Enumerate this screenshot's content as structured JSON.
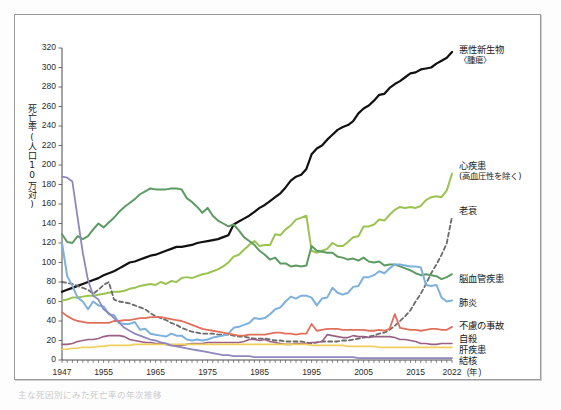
{
  "figure": {
    "y_axis_title": "死亡率(人口10万対)",
    "x_axis_unit": "(年)",
    "caption": "主な死因別にみた死亡率の年次推移"
  },
  "chart_data": {
    "type": "line",
    "title": "",
    "xlabel": "(年)",
    "ylabel": "死亡率(人口10万対)",
    "xlim": [
      1947,
      2022
    ],
    "ylim": [
      0,
      320
    ],
    "grid": false,
    "legend_position": "right-inline-labels",
    "y_ticks": [
      0,
      20,
      40,
      60,
      80,
      100,
      120,
      140,
      160,
      180,
      200,
      220,
      240,
      260,
      280,
      300,
      320
    ],
    "x_ticks": [
      1947,
      1955,
      1965,
      1975,
      1985,
      1995,
      2005,
      2015,
      2022
    ],
    "x": [
      1947,
      1948,
      1949,
      1950,
      1951,
      1952,
      1953,
      1954,
      1955,
      1956,
      1957,
      1958,
      1959,
      1960,
      1961,
      1962,
      1963,
      1964,
      1965,
      1966,
      1967,
      1968,
      1969,
      1970,
      1971,
      1972,
      1973,
      1974,
      1975,
      1976,
      1977,
      1978,
      1979,
      1980,
      1981,
      1982,
      1983,
      1984,
      1985,
      1986,
      1987,
      1988,
      1989,
      1990,
      1991,
      1992,
      1993,
      1994,
      1995,
      1996,
      1997,
      1998,
      1999,
      2000,
      2001,
      2002,
      2003,
      2004,
      2005,
      2006,
      2007,
      2008,
      2009,
      2010,
      2011,
      2012,
      2013,
      2014,
      2015,
      2016,
      2017,
      2018,
      2019,
      2020,
      2021,
      2022
    ],
    "series": [
      {
        "name": "悪性新生物〈腫瘍〉",
        "label": "悪性新生物",
        "sublabel": "〈腫瘍〉",
        "color": "#111111",
        "width": 2.2,
        "dash": "none",
        "label_y": 44,
        "values": [
          70,
          72,
          74,
          76,
          78,
          80,
          82,
          84,
          87,
          89,
          91,
          94,
          97,
          100,
          101,
          103,
          105,
          107,
          108,
          110,
          112,
          114,
          116,
          116,
          117,
          118,
          120,
          121,
          122,
          123,
          124,
          126,
          128,
          139,
          142,
          145,
          148,
          152,
          156,
          159,
          163,
          167,
          171,
          177,
          184,
          188,
          190,
          196,
          211,
          217,
          220,
          226,
          231,
          236,
          239,
          241,
          245,
          253,
          258,
          261,
          266,
          272,
          273,
          279,
          283,
          286,
          290,
          294,
          295,
          298,
          299,
          300,
          304,
          307,
          310,
          316
        ]
      },
      {
        "name": "心疾患(高血圧性を除く)",
        "label": "心疾患",
        "sublabel": "(高血圧性を除く)",
        "color": "#9ac352",
        "width": 2.0,
        "dash": "none",
        "label_y": 160,
        "values": [
          61,
          62,
          64,
          64,
          65,
          66,
          66,
          67,
          68,
          69,
          70,
          70,
          71,
          73,
          74,
          76,
          77,
          78,
          77,
          80,
          78,
          81,
          80,
          84,
          85,
          84,
          86,
          88,
          89,
          91,
          93,
          96,
          100,
          106,
          108,
          113,
          118,
          122,
          117,
          118,
          118,
          129,
          128,
          134,
          138,
          144,
          146,
          148,
          112,
          110,
          112,
          114,
          120,
          117,
          117,
          121,
          126,
          127,
          137,
          137,
          139,
          144,
          143,
          149,
          154,
          157,
          156,
          157,
          156,
          158,
          164,
          167,
          168,
          167,
          174,
          191
        ]
      },
      {
        "name": "老衰",
        "label": "老衰",
        "sublabel": "",
        "color": "#6b6b6b",
        "width": 1.8,
        "dash": "4 3",
        "label_y": 205,
        "values": [
          80,
          79,
          78,
          76,
          74,
          72,
          68,
          72,
          77,
          80,
          62,
          60,
          59,
          58,
          56,
          54,
          52,
          48,
          45,
          43,
          41,
          38,
          36,
          33,
          31,
          29,
          28,
          27,
          27,
          27,
          26,
          26,
          26,
          25,
          24,
          24,
          23,
          22,
          22,
          22,
          21,
          20,
          20,
          19,
          19,
          19,
          19,
          18,
          17,
          18,
          19,
          19,
          19,
          19,
          20,
          20,
          21,
          22,
          23,
          24,
          25,
          27,
          28,
          31,
          35,
          40,
          45,
          51,
          60,
          68,
          78,
          89,
          98,
          108,
          120,
          147
        ]
      },
      {
        "name": "脳血管疾患",
        "label": "脳血管疾患",
        "sublabel": "",
        "color": "#5d9b62",
        "width": 2.0,
        "dash": "none",
        "label_y": 273,
        "values": [
          129,
          121,
          120,
          127,
          124,
          127,
          134,
          140,
          136,
          141,
          146,
          152,
          157,
          161,
          165,
          170,
          173,
          176,
          175,
          175,
          175,
          176,
          176,
          175,
          166,
          162,
          157,
          151,
          156,
          148,
          143,
          140,
          137,
          139,
          133,
          126,
          122,
          118,
          112,
          108,
          103,
          105,
          99,
          99,
          96,
          97,
          96,
          97,
          117,
          112,
          111,
          110,
          110,
          106,
          105,
          103,
          104,
          102,
          105,
          101,
          100,
          101,
          97,
          98,
          98,
          96,
          94,
          92,
          89,
          87,
          88,
          87,
          86,
          83,
          85,
          88
        ]
      },
      {
        "name": "肺炎",
        "label": "肺炎",
        "sublabel": "",
        "color": "#7eb0dd",
        "width": 2.0,
        "dash": "none",
        "label_y": 297,
        "values": [
          120,
          86,
          76,
          64,
          60,
          52,
          60,
          56,
          55,
          47,
          46,
          38,
          37,
          37,
          39,
          31,
          32,
          27,
          26,
          25,
          24,
          27,
          25,
          25,
          21,
          20,
          21,
          20,
          21,
          23,
          24,
          25,
          27,
          33,
          34,
          36,
          38,
          43,
          42,
          43,
          47,
          52,
          54,
          60,
          65,
          63,
          66,
          66,
          64,
          56,
          63,
          64,
          74,
          69,
          67,
          69,
          75,
          76,
          85,
          85,
          87,
          91,
          89,
          94,
          98,
          98,
          97,
          96,
          96,
          95,
          77,
          76,
          77,
          64,
          60,
          61
        ]
      },
      {
        "name": "不慮の事故",
        "label": "不慮の事故",
        "sublabel": "",
        "color": "#e0705b",
        "width": 1.8,
        "dash": "none",
        "label_y": 320,
        "values": [
          49,
          45,
          42,
          40,
          39,
          38,
          38,
          38,
          38,
          38,
          40,
          40,
          41,
          41,
          42,
          43,
          43,
          44,
          44,
          44,
          43,
          42,
          41,
          40,
          38,
          36,
          34,
          32,
          31,
          30,
          29,
          28,
          27,
          26,
          25,
          25,
          26,
          26,
          26,
          26,
          27,
          28,
          28,
          27,
          27,
          26,
          27,
          27,
          37,
          30,
          31,
          32,
          32,
          32,
          31,
          31,
          31,
          31,
          31,
          30,
          30,
          31,
          30,
          32,
          47,
          33,
          32,
          31,
          31,
          30,
          31,
          32,
          32,
          31,
          31,
          34
        ]
      },
      {
        "name": "自殺",
        "label": "自殺",
        "sublabel": "",
        "color": "#9a5f87",
        "width": 1.6,
        "dash": "none",
        "label_y": 333,
        "values": [
          16,
          16,
          17,
          19,
          20,
          21,
          21,
          22,
          24,
          25,
          25,
          25,
          24,
          21,
          20,
          19,
          18,
          18,
          17,
          17,
          16,
          15,
          15,
          15,
          16,
          17,
          17,
          17,
          18,
          18,
          18,
          18,
          18,
          18,
          18,
          19,
          21,
          21,
          20,
          21,
          19,
          18,
          17,
          16,
          16,
          17,
          17,
          17,
          18,
          18,
          19,
          26,
          25,
          24,
          23,
          23,
          25,
          24,
          24,
          23,
          24,
          24,
          24,
          24,
          23,
          21,
          21,
          20,
          19,
          17,
          17,
          16,
          16,
          17,
          17,
          17
        ]
      },
      {
        "name": "肝疾患",
        "label": "肝疾患",
        "sublabel": "",
        "color": "#f0cf5a",
        "width": 1.6,
        "dash": "none",
        "label_y": 344,
        "values": [
          11,
          11,
          12,
          12,
          13,
          13,
          13,
          14,
          14,
          15,
          15,
          15,
          15,
          15,
          16,
          16,
          16,
          16,
          16,
          16,
          16,
          16,
          16,
          16,
          16,
          16,
          16,
          16,
          16,
          16,
          16,
          16,
          16,
          16,
          16,
          16,
          16,
          16,
          16,
          16,
          16,
          16,
          16,
          16,
          16,
          16,
          16,
          16,
          15,
          15,
          15,
          15,
          15,
          15,
          15,
          14,
          14,
          14,
          14,
          14,
          14,
          13,
          13,
          13,
          13,
          13,
          13,
          13,
          13,
          13,
          13,
          13,
          13,
          13,
          13,
          13
        ]
      },
      {
        "name": "結核",
        "label": "結核",
        "sublabel": "",
        "color": "#8f87bd",
        "width": 1.8,
        "dash": "none",
        "label_y": 355,
        "values": [
          188,
          187,
          183,
          146,
          110,
          82,
          66,
          62,
          52,
          48,
          43,
          38,
          33,
          30,
          27,
          25,
          23,
          21,
          20,
          18,
          17,
          15,
          14,
          13,
          12,
          11,
          10,
          9,
          8,
          7,
          6,
          5,
          5,
          4,
          4,
          4,
          4,
          3,
          3,
          3,
          3,
          3,
          3,
          3,
          3,
          3,
          3,
          3,
          3,
          3,
          3,
          3,
          3,
          3,
          3,
          3,
          3,
          2,
          2,
          2,
          2,
          2,
          2,
          2,
          2,
          2,
          2,
          2,
          2,
          2,
          2,
          2,
          2,
          2,
          2,
          2
        ]
      }
    ]
  }
}
